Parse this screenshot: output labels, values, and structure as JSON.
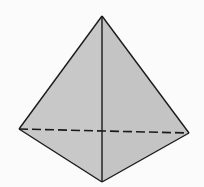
{
  "diagram": {
    "type": "tetrahedron",
    "fill_color": "#c8c8c8",
    "edge_color": "#1a1a1a",
    "background_color": "#fbfbfb",
    "vertices": {
      "apex": [
        102,
        16
      ],
      "left": [
        19,
        129
      ],
      "right": [
        189,
        133
      ],
      "front": [
        102,
        182
      ]
    },
    "edges": [
      {
        "from": "apex",
        "to": "left",
        "style": "solid"
      },
      {
        "from": "apex",
        "to": "right",
        "style": "solid"
      },
      {
        "from": "apex",
        "to": "front",
        "style": "solid"
      },
      {
        "from": "left",
        "to": "front",
        "style": "solid"
      },
      {
        "from": "right",
        "to": "front",
        "style": "solid"
      },
      {
        "from": "left",
        "to": "right",
        "style": "dashed"
      }
    ]
  }
}
